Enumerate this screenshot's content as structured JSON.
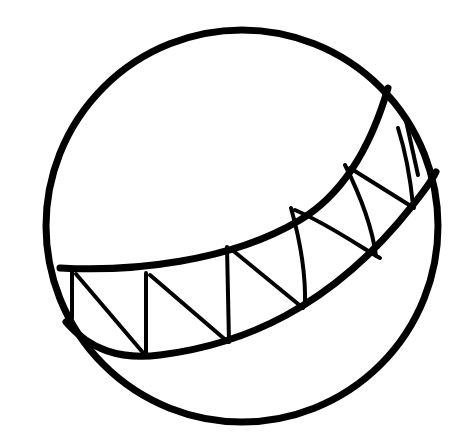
{
  "image": {
    "subject": "ball-line-drawing",
    "background": "#ffffff",
    "stroke": "#000000"
  }
}
